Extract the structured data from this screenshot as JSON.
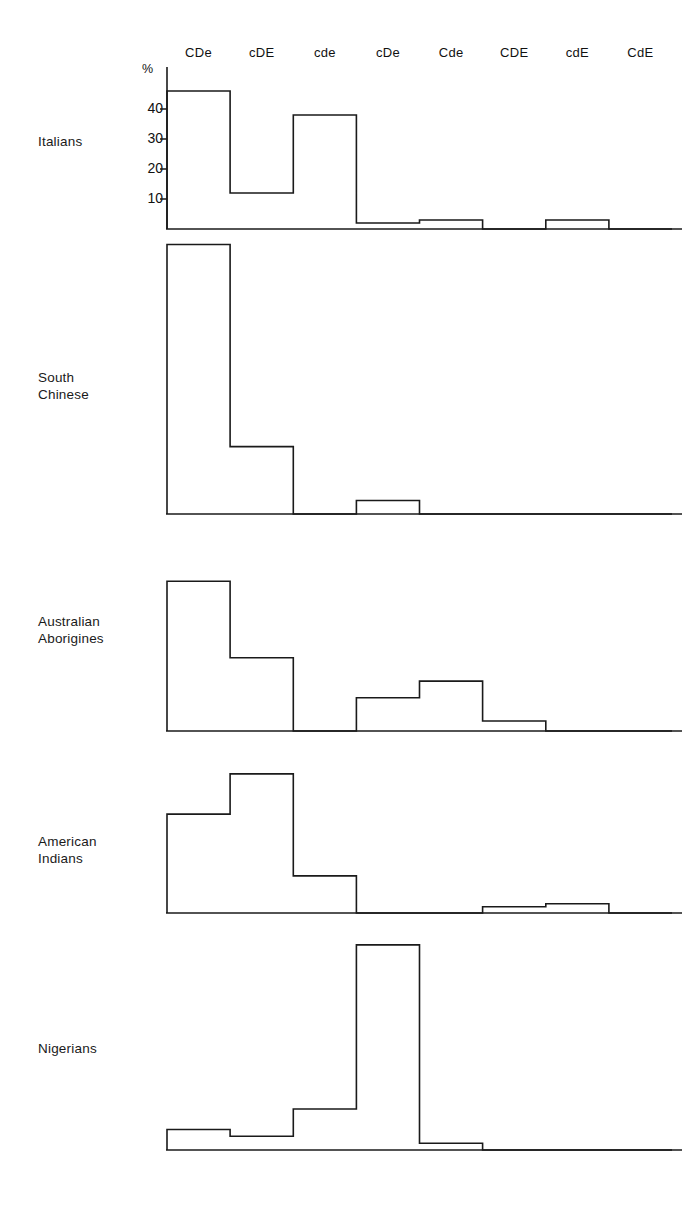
{
  "figure": {
    "axis_unit_label": "%",
    "y_ticks": [
      "40",
      "30",
      "20",
      "10"
    ],
    "categories": [
      "CDe",
      "cDE",
      "cde",
      "cDe",
      "Cde",
      "CDE",
      "cdE",
      "CdE"
    ],
    "populations": [
      "Italians",
      "South\nChinese",
      "Australian\nAborigines",
      "American\nIndians",
      "Nigerians"
    ],
    "stroke_color": "#1a1a1a"
  },
  "chart_data": {
    "type": "bar",
    "title": "",
    "xlabel": "",
    "ylabel": "%",
    "ylim": [
      0,
      55
    ],
    "grid": false,
    "legend": "none",
    "axis_note": "Only the Italians panel carries the % axis with ticks at 10, 20, 30, 40; the other four panels share the same vertical scale but are drawn without tick marks.",
    "categories": [
      "CDe",
      "cDE",
      "cde",
      "cDe",
      "Cde",
      "CDE",
      "cdE",
      "CdE"
    ],
    "tick_labels_y": [
      10,
      20,
      30,
      40
    ],
    "series": [
      {
        "name": "Italians",
        "values": [
          46,
          12,
          38,
          2,
          3,
          0,
          3,
          0
        ]
      },
      {
        "name": "South Chinese",
        "values": [
          60,
          15,
          0,
          3,
          0,
          0,
          0,
          0
        ]
      },
      {
        "name": "Australian Aborigines",
        "values": [
          45,
          22,
          0,
          10,
          15,
          3,
          0,
          0
        ]
      },
      {
        "name": "American Indians",
        "values": [
          32,
          45,
          12,
          0,
          0,
          2,
          3,
          0
        ]
      },
      {
        "name": "Nigerians",
        "values": [
          6,
          4,
          12,
          60,
          2,
          0,
          0,
          0
        ]
      }
    ]
  }
}
